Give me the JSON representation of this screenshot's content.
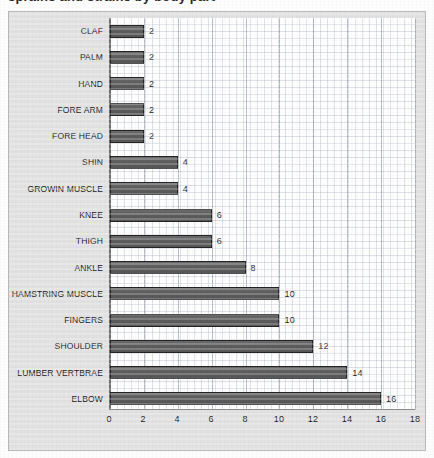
{
  "clipped_heading": "sprains and strains by body part",
  "colors": {
    "bar_fill": "#5f5f5f",
    "bar_border": "#242424",
    "chart_background": "#e2e2e2",
    "plot_background": "#ffffff",
    "grid": "#96a0af",
    "axis": "#6f6f6f",
    "text": "#1c1c1c"
  },
  "chart_data": {
    "type": "bar",
    "orientation": "horizontal",
    "title": "",
    "xlabel": "",
    "ylabel": "",
    "xlim": [
      0,
      18
    ],
    "xticks": [
      0,
      2,
      4,
      6,
      8,
      10,
      12,
      14,
      16,
      18
    ],
    "grid": true,
    "legend": false,
    "data_labels": true,
    "categories": [
      "CLAF",
      "PALM",
      "HAND",
      "FORE ARM",
      "FORE HEAD",
      "SHIN",
      "GROWIN MUSCLE",
      "KNEE",
      "THIGH",
      "ANKLE",
      "HAMSTRING MUSCLE",
      "FINGERS",
      "SHOULDER",
      "LUMBER VERTBRAE",
      "ELBOW"
    ],
    "values": [
      2,
      2,
      2,
      2,
      2,
      4,
      4,
      6,
      6,
      8,
      10,
      10,
      12,
      14,
      16
    ],
    "value_labels": [
      "2",
      "2",
      "2",
      "2",
      "2",
      "4",
      "4",
      "6",
      "6",
      "8",
      "10",
      "10",
      "12",
      "14",
      "16"
    ],
    "tick_labels": [
      "0",
      "2",
      "4",
      "6",
      "8",
      "10",
      "12",
      "14",
      "16",
      "18"
    ]
  }
}
